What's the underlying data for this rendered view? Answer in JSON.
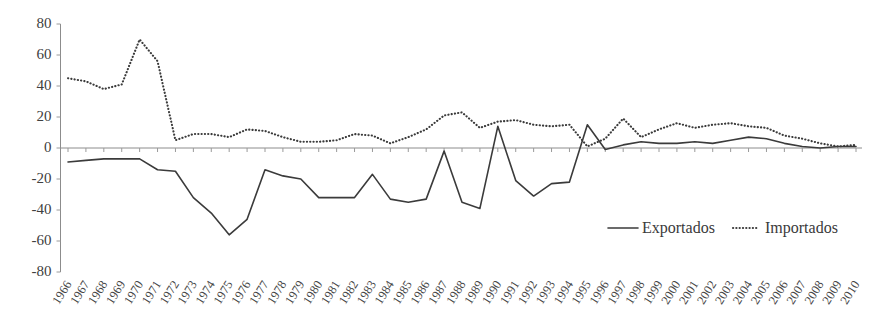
{
  "legend": {
    "position": "bottom-right",
    "entries": [
      {
        "label": "Exportados",
        "style": "solid",
        "color": "#3b3b3b"
      },
      {
        "label": "Importados",
        "style": "dotted",
        "color": "#3b3b3b"
      }
    ]
  },
  "axis": {
    "y_ticks": [
      "80",
      "60",
      "40",
      "20",
      "0",
      "-20",
      "-40",
      "-60",
      "-80"
    ],
    "x_first": "1966",
    "x_last": "2010"
  },
  "chart_data": {
    "type": "line",
    "title": "",
    "subtitle": "",
    "xlabel": "",
    "ylabel": "",
    "ylim": [
      -80,
      80
    ],
    "ytick_step": 20,
    "grid": false,
    "legend_position": "bottom-right",
    "categories": [
      "1966",
      "1967",
      "1968",
      "1969",
      "1970",
      "1971",
      "1972",
      "1973",
      "1974",
      "1975",
      "1976",
      "1977",
      "1978",
      "1979",
      "1980",
      "1981",
      "1982",
      "1983",
      "1984",
      "1985",
      "1986",
      "1987",
      "1988",
      "1989",
      "1990",
      "1991",
      "1992",
      "1993",
      "1994",
      "1995",
      "1996",
      "1997",
      "1998",
      "1999",
      "2000",
      "2001",
      "2002",
      "2003",
      "2004",
      "2005",
      "2006",
      "2007",
      "2008",
      "2009",
      "2010"
    ],
    "series": [
      {
        "name": "Exportados",
        "style": "solid",
        "color": "#3b3b3b",
        "values": [
          -9,
          -8,
          -7,
          -7,
          -7,
          -14,
          -15,
          -32,
          -42,
          -56,
          -46,
          -14,
          -18,
          -20,
          -32,
          -32,
          -32,
          -17,
          -33,
          -35,
          -33,
          -2,
          -35,
          -39,
          14,
          -21,
          -31,
          -23,
          -22,
          15,
          -1,
          2,
          4,
          3,
          3,
          4,
          3,
          5,
          7,
          6,
          3,
          1,
          0,
          1,
          1
        ]
      },
      {
        "name": "Importados",
        "style": "dotted",
        "color": "#3b3b3b",
        "values": [
          45,
          43,
          38,
          41,
          70,
          56,
          5,
          9,
          9,
          7,
          12,
          11,
          7,
          4,
          4,
          5,
          9,
          8,
          3,
          7,
          12,
          21,
          23,
          13,
          17,
          18,
          15,
          14,
          15,
          1,
          6,
          19,
          7,
          12,
          16,
          13,
          15,
          16,
          14,
          13,
          8,
          6,
          3,
          1,
          2
        ]
      }
    ]
  }
}
